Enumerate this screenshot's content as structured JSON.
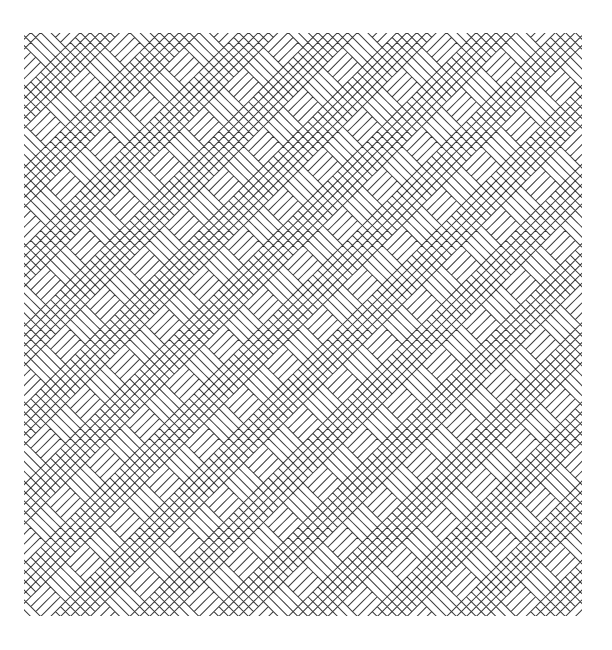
{
  "artwork": {
    "title": "Diagonal basketweave line pattern",
    "background": "#ffffff",
    "line_color": "#3a3a3a",
    "line_width": 1.0,
    "line_spacing": 7,
    "rotation_deg": 45,
    "block_cells": 4,
    "bounds": {
      "x": 24,
      "y": 33,
      "width": 558,
      "height": 583
    }
  }
}
